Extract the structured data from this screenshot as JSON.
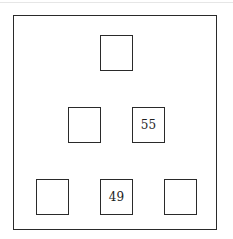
{
  "diagram": {
    "type": "number-pyramid",
    "rows": [
      [
        {
          "value": ""
        }
      ],
      [
        {
          "value": ""
        },
        {
          "value": "55"
        }
      ],
      [
        {
          "value": ""
        },
        {
          "value": "49"
        },
        {
          "value": ""
        }
      ]
    ]
  }
}
